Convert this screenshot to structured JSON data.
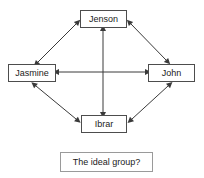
{
  "diagram": {
    "title_caption": "The ideal group?",
    "nodes": [
      {
        "id": "jenson",
        "label": "Jenson",
        "position": "top"
      },
      {
        "id": "jasmine",
        "label": "Jasmine",
        "position": "left"
      },
      {
        "id": "john",
        "label": "John",
        "position": "right"
      },
      {
        "id": "ibrar",
        "label": "Ibrar",
        "position": "bottom"
      }
    ],
    "edges": [
      {
        "from": "jasmine",
        "to": "jenson",
        "style": "double-arrow",
        "kind": "diagonal"
      },
      {
        "from": "jenson",
        "to": "john",
        "style": "double-arrow",
        "kind": "diagonal"
      },
      {
        "from": "jasmine",
        "to": "ibrar",
        "style": "double-arrow",
        "kind": "diagonal"
      },
      {
        "from": "ibrar",
        "to": "john",
        "style": "double-arrow",
        "kind": "diagonal"
      },
      {
        "from": "jasmine",
        "to": "john",
        "style": "double-arrow",
        "kind": "horizontal"
      },
      {
        "from": "jenson",
        "to": "ibrar",
        "style": "double-arrow",
        "kind": "vertical"
      }
    ],
    "colors": {
      "node_border": "#4d4d4d",
      "caption_border": "#9a9a9a",
      "edge": "#3a3a3a",
      "text": "#1a1a1a",
      "background": "#ffffff"
    }
  }
}
